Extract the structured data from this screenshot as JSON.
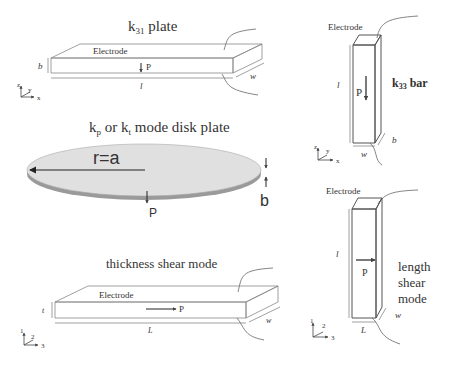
{
  "diagrams": {
    "k31_plate": {
      "title_main": "k",
      "title_sub": "31",
      "title_rest": " plate",
      "electrode": "Electrode",
      "polarization": "P",
      "dim_thickness": "b",
      "dim_length": "l",
      "dim_width": "w",
      "axes": {
        "vertical": "z",
        "depth": "y",
        "horizontal": "x"
      }
    },
    "disk_plate": {
      "title_k1": "k",
      "title_sub1": "p",
      "title_mid": " or k",
      "title_sub2": "t",
      "title_rest": " mode disk plate",
      "radius_label": "r=a",
      "polarization": "P",
      "dim_thickness": "b",
      "colors": {
        "top": "#e0e0e0",
        "edge": "#9a9a9a"
      }
    },
    "thickness_shear": {
      "title": "thickness shear mode",
      "electrode": "Electrode",
      "polarization": "P",
      "dim_thickness": "t",
      "dim_length": "L",
      "dim_width": "w",
      "axes": {
        "vertical": "1",
        "depth": "2",
        "horizontal": "3"
      }
    },
    "k33_bar": {
      "title_main": "k",
      "title_sub": "33",
      "title_rest": " bar",
      "electrode": "Electrode",
      "polarization": "P",
      "dim_length": "l",
      "dim_width": "w",
      "dim_thickness": "b",
      "axes": {
        "vertical": "z",
        "depth": "y",
        "horizontal": "x"
      }
    },
    "length_shear": {
      "title_lines": [
        "length",
        "shear",
        "mode"
      ],
      "electrode": "Electrode",
      "polarization": "P",
      "dim_length": "l",
      "dim_width": "L",
      "dim_thickness": "w",
      "axes": {
        "vertical": "1",
        "depth": "2",
        "horizontal": "3"
      }
    }
  }
}
